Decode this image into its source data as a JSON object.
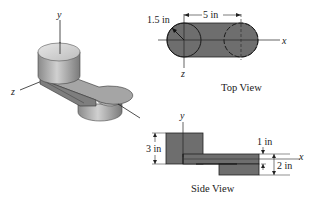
{
  "isometric_view": {
    "axes": {
      "y": "y",
      "z": "z",
      "x": ""
    }
  },
  "top_view": {
    "caption": "Top View",
    "radius_label": "1.5 in",
    "spacing_label": "5 in",
    "axis_x": "x",
    "axis_z": "z"
  },
  "side_view": {
    "caption": "Side View",
    "height_label": "3 in",
    "thickness_label": "1 in",
    "offset_label": "2 in",
    "axis_x": "x",
    "axis_y": "y"
  },
  "colors": {
    "fill_dark": "#6e6e6e",
    "stroke": "#1a1a1a",
    "solid_light": "#d8d8d8",
    "solid_mid": "#9a9a9a"
  }
}
